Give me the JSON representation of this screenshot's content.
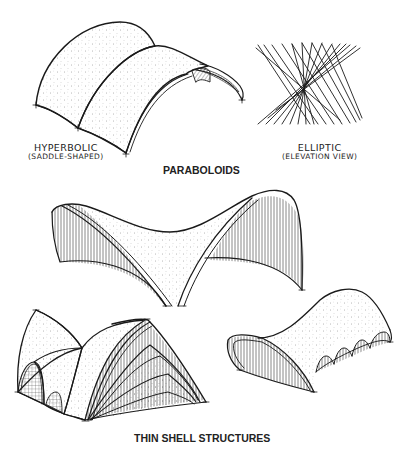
{
  "figure": {
    "section_paraboloids": {
      "caption": "PARABOLOIDS",
      "hyperbolic": {
        "label_line1": "HYPERBOLIC",
        "label_line2": "(SADDLE-SHAPED)"
      },
      "elliptic": {
        "label_line1": "ELLIPTIC",
        "label_line2": "(ELEVATION VIEW)"
      }
    },
    "section_thin_shell": {
      "caption": "THIN SHELL STRUCTURES"
    },
    "colors": {
      "ink": "#1a1a1a",
      "paper": "#ffffff",
      "stipple": "#555555"
    }
  }
}
